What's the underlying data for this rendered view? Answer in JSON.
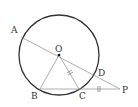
{
  "diagram": {
    "type": "geometry",
    "circle": {
      "center": "O",
      "cx": 59,
      "cy": 55,
      "r": 40,
      "stroke": "#333333"
    },
    "points": {
      "A": {
        "label": "A",
        "x": 21,
        "y": 37,
        "lx": 11,
        "ly": 33
      },
      "O": {
        "label": "O",
        "x": 59,
        "y": 55,
        "lx": 55,
        "ly": 52
      },
      "B": {
        "label": "B",
        "x": 40,
        "y": 89,
        "lx": 31,
        "ly": 99
      },
      "C": {
        "label": "C",
        "x": 79,
        "y": 89,
        "lx": 79,
        "ly": 99
      },
      "D": {
        "label": "D",
        "x": 95,
        "y": 73,
        "lx": 98,
        "ly": 76
      },
      "P": {
        "label": "P",
        "x": 120,
        "y": 89,
        "lx": 122,
        "ly": 93
      }
    },
    "segments": [
      "AP",
      "BP",
      "OB",
      "OC"
    ],
    "equal_marks": [
      "OC",
      "CP"
    ],
    "line_color": "#aaaaaa"
  }
}
